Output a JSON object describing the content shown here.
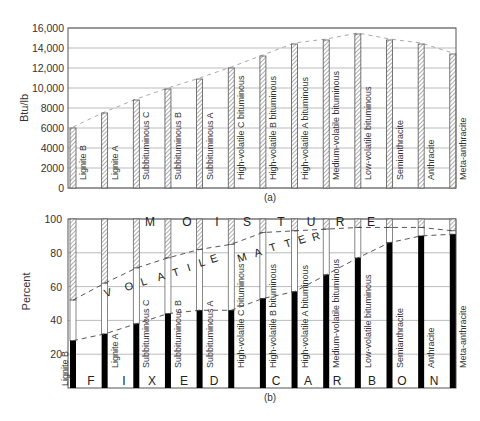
{
  "chart_data": [
    {
      "type": "bar",
      "panel": "(a)",
      "title": "",
      "xlabel": "",
      "ylabel": "Btu/lb",
      "ylim": [
        0,
        16000
      ],
      "yticks": [
        "0",
        "2000",
        "4000",
        "6000",
        "8000",
        "10,000",
        "12,000",
        "14,000",
        "16,000"
      ],
      "grid": true,
      "categories": [
        "Lignite B",
        "Lignite A",
        "Subbituminous C",
        "Subbituminous B",
        "Subbituminous A",
        "High-volatile C bituminous",
        "High-volatile B bituminous",
        "High-volatile A bituminous",
        "Medium-volatile bituminous",
        "Low-volatile bituminous",
        "Semianthracite",
        "Anthracite",
        "Meta-anthracite"
      ],
      "values": [
        6000,
        7500,
        8800,
        9900,
        10900,
        12000,
        13200,
        14400,
        14800,
        15400,
        14800,
        14400,
        13400
      ],
      "trend_line": "dashed envelope through bar tops"
    },
    {
      "type": "bar",
      "stacked": true,
      "panel": "(b)",
      "title": "",
      "xlabel": "",
      "ylabel": "Percent",
      "ylim": [
        0,
        100
      ],
      "yticks": [
        "20",
        "40",
        "60",
        "80",
        "100"
      ],
      "grid": true,
      "categories": [
        "Lignite B",
        "Lignite A",
        "Subbituminous C",
        "Subbituminous B",
        "Subbituminous A",
        "High-volatile C bituminous",
        "High-volatile B bituminous",
        "High-volatile A bituminous",
        "Medium-volatile bituminous",
        "Low-volatile bituminous",
        "Semianthracite",
        "Anthracite",
        "Meta-anthracite"
      ],
      "series": [
        {
          "name": "Fixed carbon",
          "color": "#000000",
          "values": [
            28,
            32,
            38,
            44,
            46,
            46,
            53,
            57,
            67,
            77,
            86,
            90,
            91
          ]
        },
        {
          "name": "Volatile matter",
          "color": "#ffffff",
          "values": [
            24,
            30,
            33,
            33,
            36,
            39,
            39,
            36,
            27,
            18,
            9,
            5,
            2
          ]
        },
        {
          "name": "Moisture",
          "color": "hatched",
          "values": [
            48,
            38,
            29,
            23,
            18,
            15,
            8,
            7,
            6,
            5,
            5,
            5,
            7
          ]
        }
      ],
      "region_labels": {
        "moisture": [
          "M",
          "O",
          "I",
          "S",
          "T",
          "U",
          "R",
          "E"
        ],
        "volatile_matter": [
          "V",
          "O",
          "L",
          "A",
          "T",
          "I",
          "L",
          "E",
          "M",
          "A",
          "T",
          "T",
          "E",
          "R"
        ],
        "fixed_carbon": [
          "F",
          "I",
          "X",
          "E",
          "D",
          "C",
          "A",
          "R",
          "B",
          "O",
          "N"
        ]
      }
    }
  ],
  "labels": {
    "panel_a": "(a)",
    "panel_b": "(b)",
    "ylabel_a": "Btu/lb",
    "ylabel_b": "Percent"
  }
}
